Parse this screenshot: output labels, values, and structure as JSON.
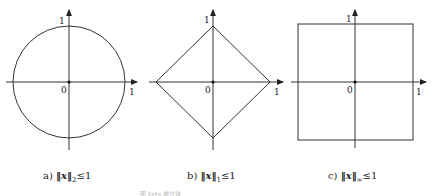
{
  "panels": [
    {
      "id": "a",
      "shape": "circle",
      "origin_label": "0",
      "x_tick_label": "1",
      "y_tick_label": "1",
      "caption_prefix": "a)",
      "caption_norm_sub": "2",
      "caption_rel": "≤1"
    },
    {
      "id": "b",
      "shape": "diamond",
      "origin_label": "0",
      "x_tick_label": "1",
      "y_tick_label": "1",
      "caption_prefix": "b)",
      "caption_norm_sub": "1",
      "caption_rel": "≤1"
    },
    {
      "id": "c",
      "shape": "square",
      "origin_label": "0",
      "x_tick_label": "1",
      "y_tick_label": "1",
      "caption_prefix": "c)",
      "caption_norm_sub": "∞",
      "caption_rel": "≤1"
    }
  ],
  "norm_symbol": "‖x‖",
  "figure_caption": "图 ‖x‖p 单位球"
}
